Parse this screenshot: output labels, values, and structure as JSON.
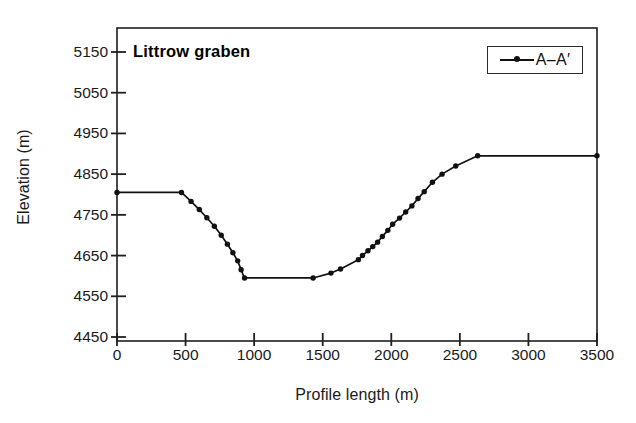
{
  "chart_data": {
    "type": "line",
    "title": "Littrow graben",
    "xlabel": "Profile length (m)",
    "ylabel": "Elevation (m)",
    "xlim": [
      0,
      3500
    ],
    "ylim": [
      4450,
      5200
    ],
    "xticks": [
      0,
      500,
      1000,
      1500,
      2000,
      2500,
      3000,
      3500
    ],
    "yticks": [
      4450,
      4550,
      4650,
      4750,
      4850,
      4950,
      5050,
      5150
    ],
    "grid": false,
    "legend_position": "top-right",
    "series": [
      {
        "name": "A–A′",
        "marker": "filled-circle",
        "color": "#111111",
        "x": [
          0,
          470,
          540,
          600,
          655,
          710,
          760,
          805,
          845,
          880,
          905,
          930,
          1430,
          1560,
          1630,
          1760,
          1790,
          1830,
          1865,
          1900,
          1935,
          1975,
          2010,
          2060,
          2105,
          2150,
          2195,
          2240,
          2300,
          2370,
          2470,
          2630,
          3500
        ],
        "y": [
          4805,
          4805,
          4783,
          4763,
          4743,
          4722,
          4700,
          4678,
          4657,
          4637,
          4615,
          4595,
          4595,
          4607,
          4617,
          4640,
          4650,
          4662,
          4672,
          4683,
          4697,
          4712,
          4727,
          4742,
          4757,
          4772,
          4790,
          4807,
          4830,
          4850,
          4870,
          4895,
          4895
        ]
      }
    ]
  },
  "axes": {
    "y_tick_labels": [
      "5150",
      "5050",
      "4950",
      "4850",
      "4750",
      "4650",
      "4550",
      "4450"
    ],
    "x_tick_labels": [
      "0",
      "500",
      "1000",
      "1500",
      "2000",
      "2500",
      "3000",
      "3500"
    ],
    "y_title": "Elevation (m)",
    "x_title": "Profile length (m)"
  },
  "legend": {
    "label": "A–A′"
  }
}
